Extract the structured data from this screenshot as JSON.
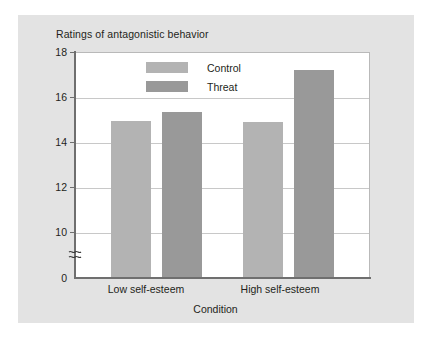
{
  "chart_data": {
    "type": "bar",
    "title": "Ratings of antagonistic behavior",
    "xlabel": "Condition",
    "ylabel": "",
    "categories": [
      "Low self-esteem",
      "High self-esteem"
    ],
    "series": [
      {
        "name": "Control",
        "values": [
          12.5,
          12.4
        ],
        "color": "#b3b3b3"
      },
      {
        "name": "Threat",
        "values": [
          13.25,
          16.55
        ],
        "color": "#999999"
      }
    ],
    "ylim": [
      0,
      18
    ],
    "y_ticks": [
      {
        "label": "18",
        "value": 18
      },
      {
        "label": "16",
        "value": 16
      },
      {
        "label": "14",
        "value": 14
      },
      {
        "label": "12",
        "value": 12
      },
      {
        "label": "10",
        "value": 10
      },
      {
        "label": "0",
        "value": 0
      }
    ],
    "axis_break": true,
    "axis_break_between": [
      0,
      10
    ],
    "grid": "horizontal",
    "legend_position": "top-center",
    "plot_background": "#ffffff",
    "figure_background": "#e3e3e3",
    "grid_color": "#c8c8c8",
    "axis_color": "#6f6f6f",
    "text_color": "#231f20"
  },
  "legend": {
    "entries": [
      {
        "label": "Control"
      },
      {
        "label": "Threat"
      }
    ]
  }
}
